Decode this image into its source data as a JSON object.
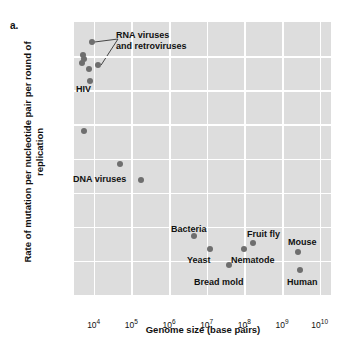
{
  "figure": {
    "panel_label": "a.",
    "y_axis_title": "Rate of mutation per nucleotide pair per round of replication",
    "x_axis_title": "Genome size (base pairs)"
  },
  "style": {
    "plot_background": "#dddddd",
    "gridline_color": "#ffffff",
    "marker_color": "#6e6e6e",
    "text_color": "#111111"
  },
  "chart_data": {
    "type": "scatter",
    "title": "",
    "xlabel": "Genome size (base pairs)",
    "ylabel": "Rate of mutation per nucleotide pair per round of replication",
    "xscale": "log",
    "yscale": "log",
    "xlim": [
      3000,
      20000000000
    ],
    "ylim": [
      1e-11,
      0.001
    ],
    "grid": true,
    "legend": "none",
    "x_ticks": [
      {
        "value": 10000,
        "label": "10",
        "exponent": "4"
      },
      {
        "value": 100000,
        "label": "10",
        "exponent": "5"
      },
      {
        "value": 1000000,
        "label": "10",
        "exponent": "6"
      },
      {
        "value": 10000000,
        "label": "10",
        "exponent": "7"
      },
      {
        "value": 100000000,
        "label": "10",
        "exponent": "8"
      },
      {
        "value": 1000000000,
        "label": "10",
        "exponent": "9"
      },
      {
        "value": 10000000000,
        "label": "10",
        "exponent": "10"
      }
    ],
    "y_ticks": [
      {
        "value": 0.001,
        "label": "10",
        "exponent": "−3"
      },
      {
        "value": 0.0001,
        "label": "10",
        "exponent": "−4"
      },
      {
        "value": 1e-05,
        "label": "10",
        "exponent": "−5"
      },
      {
        "value": 1e-06,
        "label": "10",
        "exponent": "−6"
      },
      {
        "value": 1e-07,
        "label": "10",
        "exponent": "−7"
      },
      {
        "value": 1e-08,
        "label": "10",
        "exponent": "−8"
      },
      {
        "value": 1e-09,
        "label": "10",
        "exponent": "−9"
      },
      {
        "value": 1e-10,
        "label": "10",
        "exponent": "−10"
      },
      {
        "value": 1e-11,
        "label": "10",
        "exponent": "−11"
      }
    ],
    "points": [
      {
        "name": "rna-virus-1",
        "x": 9000,
        "y": 0.00026
      },
      {
        "name": "rna-virus-2",
        "x": 5200,
        "y": 0.000105
      },
      {
        "name": "rna-virus-3",
        "x": 5400,
        "y": 8e-05
      },
      {
        "name": "rna-virus-4",
        "x": 5000,
        "y": 6.2e-05
      },
      {
        "name": "rna-virus-5",
        "x": 13000,
        "y": 5.4e-05
      },
      {
        "name": "rna-virus-6",
        "x": 7400,
        "y": 4.2e-05
      },
      {
        "name": "hiv",
        "x": 8200,
        "y": 1.9e-05
      },
      {
        "name": "dna-virus-1",
        "x": 5600,
        "y": 6.5e-07
      },
      {
        "name": "dna-virus-2",
        "x": 50000,
        "y": 7e-08
      },
      {
        "name": "dna-virus-3",
        "x": 180000,
        "y": 2.3e-08
      },
      {
        "name": "bacteria",
        "x": 4600000,
        "y": 5.2e-10
      },
      {
        "name": "yeast",
        "x": 12000000,
        "y": 2.2e-10
      },
      {
        "name": "bread-mold",
        "x": 40000000,
        "y": 7.5e-11
      },
      {
        "name": "nematode",
        "x": 97000000,
        "y": 2.3e-10
      },
      {
        "name": "fruit-fly",
        "x": 170000000,
        "y": 3.4e-10
      },
      {
        "name": "mouse",
        "x": 2700000000,
        "y": 1.8e-10
      },
      {
        "name": "human",
        "x": 3000000000,
        "y": 5.3e-11
      }
    ],
    "annotations": [
      {
        "name": "rna-viruses",
        "text_line1": "RNA viruses",
        "text_line2": "and retroviruses",
        "points_to": [
          "rna-virus-1",
          "rna-virus-5"
        ]
      },
      {
        "name": "hiv",
        "text_line1": "HIV",
        "text_line2": "",
        "points_to": [
          "hiv"
        ]
      },
      {
        "name": "dna-viruses",
        "text_line1": "DNA viruses",
        "text_line2": "",
        "points_to": [
          "dna-virus-2",
          "dna-virus-3"
        ]
      },
      {
        "name": "bacteria",
        "text_line1": "Bacteria",
        "text_line2": "",
        "points_to": [
          "bacteria"
        ]
      },
      {
        "name": "yeast",
        "text_line1": "Yeast",
        "text_line2": "",
        "points_to": [
          "yeast"
        ]
      },
      {
        "name": "bread-mold",
        "text_line1": "Bread mold",
        "text_line2": "",
        "points_to": [
          "bread-mold"
        ]
      },
      {
        "name": "nematode",
        "text_line1": "Nematode",
        "text_line2": "",
        "points_to": [
          "nematode"
        ]
      },
      {
        "name": "fruit-fly",
        "text_line1": "Fruit fly",
        "text_line2": "",
        "points_to": [
          "fruit-fly"
        ]
      },
      {
        "name": "mouse",
        "text_line1": "Mouse",
        "text_line2": "",
        "points_to": [
          "mouse"
        ]
      },
      {
        "name": "human",
        "text_line1": "Human",
        "text_line2": "",
        "points_to": [
          "human"
        ]
      }
    ]
  },
  "labels": {
    "rna_line1": "RNA viruses",
    "rna_line2": "and retroviruses",
    "hiv": "HIV",
    "dna_viruses": "DNA viruses",
    "bacteria": "Bacteria",
    "yeast": "Yeast",
    "bread_mold": "Bread mold",
    "nematode": "Nematode",
    "fruit_fly": "Fruit fly",
    "mouse": "Mouse",
    "human": "Human"
  }
}
